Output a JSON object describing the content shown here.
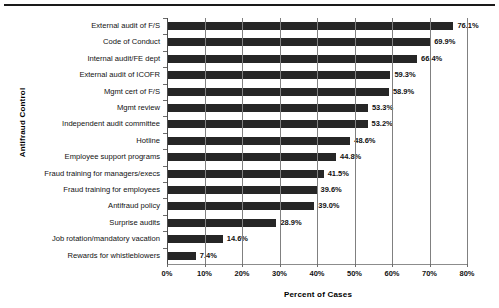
{
  "chart_data": {
    "type": "bar",
    "orientation": "horizontal",
    "title": "",
    "xlabel": "Percent of Cases",
    "ylabel": "Antifraud Control",
    "xlim": [
      0,
      80
    ],
    "xtick_labels": [
      "0%",
      "10%",
      "20%",
      "30%",
      "40%",
      "50%",
      "60%",
      "70%",
      "80%"
    ],
    "xticks": [
      0,
      10,
      20,
      30,
      40,
      50,
      60,
      70,
      80
    ],
    "grid": "vertical",
    "legend": "none",
    "bar_color": "#262626",
    "categories": [
      "External audit of F/S",
      "Code of Conduct",
      "Internal audit/FE dept",
      "External audit of ICOFR",
      "Mgmt cert of F/S",
      "Mgmt review",
      "Independent audit committee",
      "Hotline",
      "Employee support programs",
      "Fraud training for managers/execs",
      "Fraud training for employees",
      "Antifraud policy",
      "Surprise audits",
      "Job rotation/mandatory vacation",
      "Rewards for whistleblowers"
    ],
    "values": [
      76.1,
      69.9,
      66.4,
      59.3,
      58.9,
      53.3,
      53.2,
      48.6,
      44.8,
      41.5,
      39.6,
      39.0,
      28.9,
      14.6,
      7.4
    ],
    "value_labels": [
      "76.1%",
      "69.9%",
      "66.4%",
      "59.3%",
      "58.9%",
      "53.3%",
      "53.2%",
      "48.6%",
      "44.8%",
      "41.5%",
      "39.6%",
      "39.0%",
      "28.9%",
      "14.6%",
      "7.4%"
    ]
  }
}
